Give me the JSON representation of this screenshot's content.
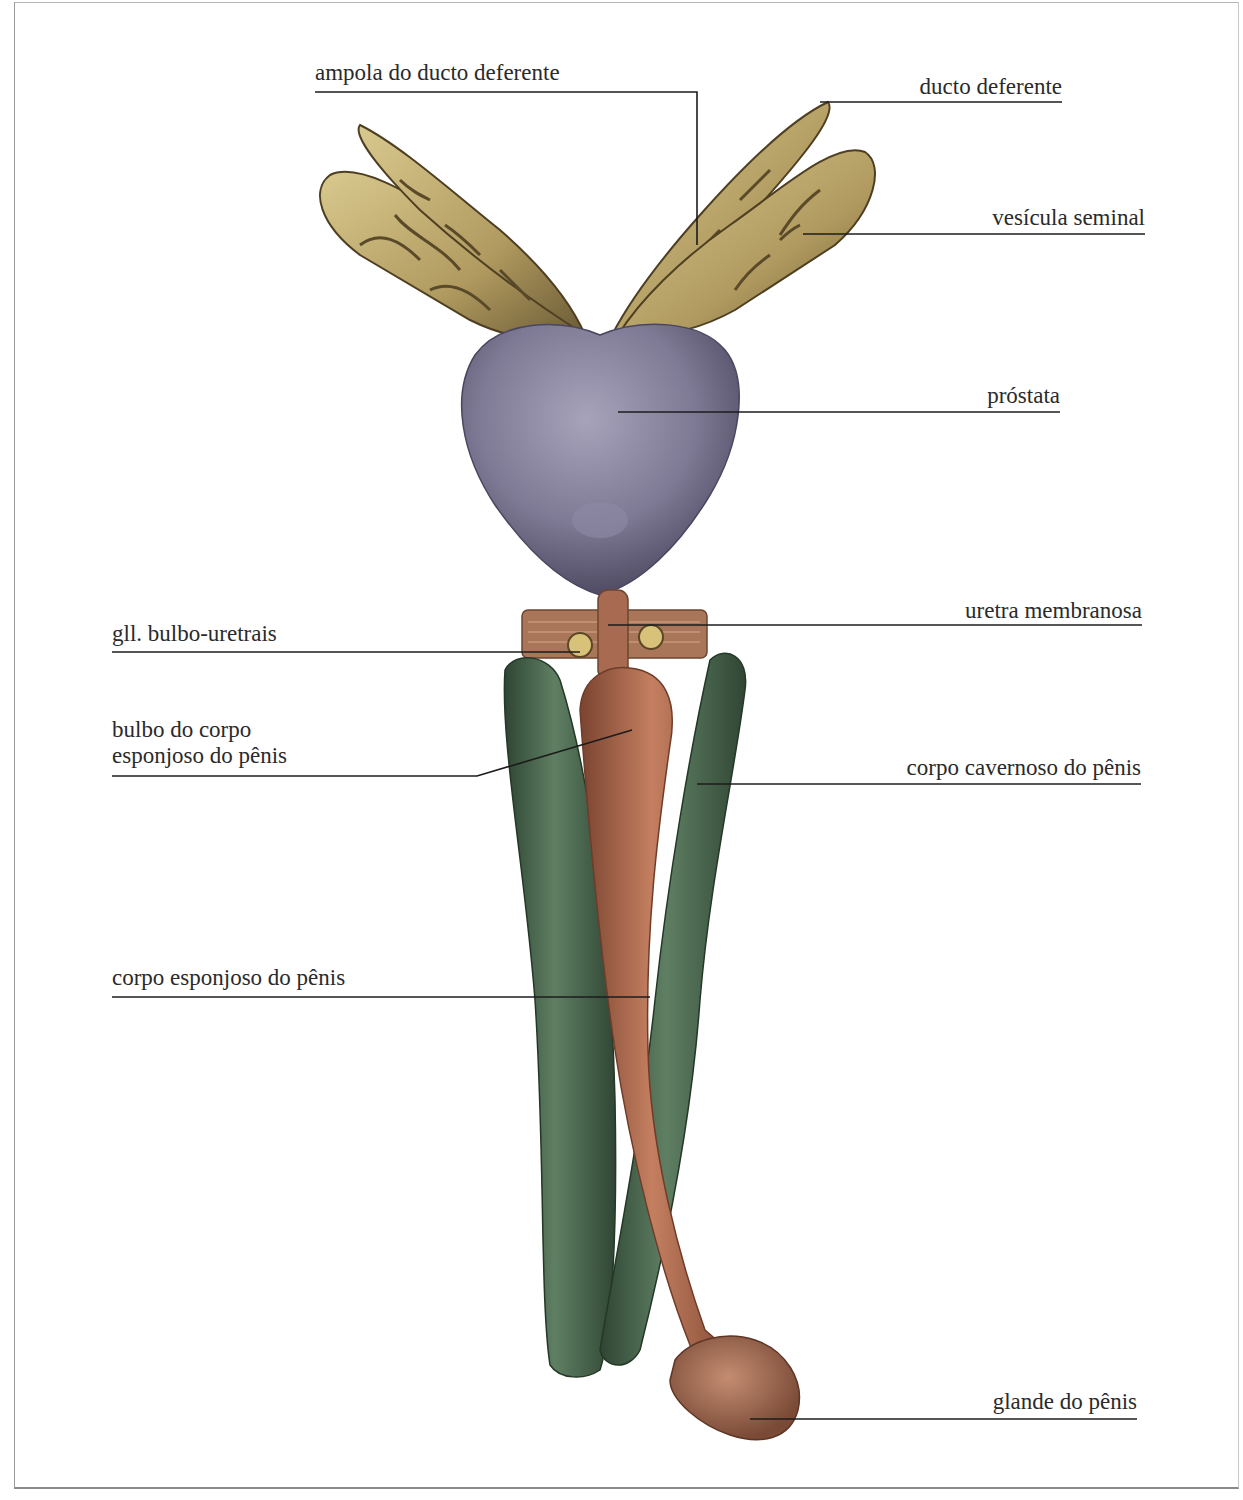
{
  "figure": {
    "labels": {
      "ampola": "ampola do ducto deferente",
      "ducto": "ducto deferente",
      "vesicula": "vesícula seminal",
      "prostata": "próstata",
      "uretra": "uretra membranosa",
      "glandulas": "gll. bulbo-uretrais",
      "bulbo_line1": "bulbo do corpo",
      "bulbo_line2": "esponjoso do pênis",
      "cavernoso": "corpo cavernoso do pênis",
      "esponjoso": "corpo esponjoso do pênis",
      "glande": "glande do pênis"
    },
    "colors": {
      "vesicle": "#b9a46a",
      "vesicle_dark": "#5a4a2a",
      "prostate": "#7e7a95",
      "prostate_dark": "#4f4b63",
      "cavernosum": "#4e6b52",
      "cavernosum_dark": "#2e4533",
      "spongiosum": "#b56f52",
      "spongiosum_dark": "#7a4430",
      "diaphragm": "#a9765a",
      "leader": "#1c1c1c"
    }
  }
}
